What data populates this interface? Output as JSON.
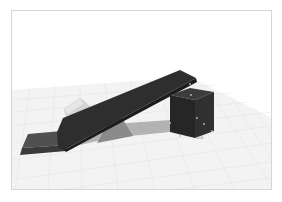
{
  "viewport": {
    "name": "3D modeling workspace",
    "background": "#ffffff",
    "frame_border": "#d6d6d6"
  },
  "scene": {
    "floor": {
      "color": "#f2f2f2",
      "grid_color": "#dcdcdc"
    },
    "objects": [
      {
        "id": "ramp-plank",
        "type": "box",
        "color": "#2b2b2b"
      },
      {
        "id": "base-slab",
        "type": "box",
        "color": "#4a4a4a"
      },
      {
        "id": "translucent-block",
        "type": "box",
        "color": "#cfcfcf"
      },
      {
        "id": "support-wedge",
        "type": "wedge",
        "color": "#8a8a8a"
      },
      {
        "id": "selected-cube",
        "type": "box",
        "color": "#2a2a2a",
        "selected": true
      }
    ],
    "shadow_color": "#9a9a9a"
  },
  "annotations": {
    "cube_dimension_label": "20.00"
  }
}
